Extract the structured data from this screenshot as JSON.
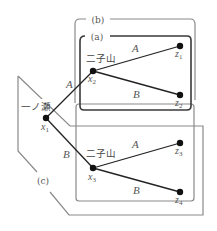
{
  "diagram": {
    "title": "",
    "colors": {
      "background": "#ffffff",
      "frame_b": "#8a8a8a",
      "frame_a": "#3a3a3a",
      "frame_c": "#8a8a8a",
      "edge": "#222222",
      "node": "#111111",
      "label": "#555555"
    },
    "regions": [
      {
        "id": "b",
        "label": "(b)"
      },
      {
        "id": "a",
        "label": "(a)"
      },
      {
        "id": "c",
        "label": "(c)"
      }
    ],
    "places": {
      "ichinose": "一ノ瀬",
      "futagoyama_upper": "二子山",
      "futagoyama_lower": "二子山"
    },
    "nodes": [
      {
        "id": "x1",
        "label": "x",
        "sub": "1"
      },
      {
        "id": "x2",
        "label": "x",
        "sub": "2"
      },
      {
        "id": "x3",
        "label": "x",
        "sub": "3"
      },
      {
        "id": "z1",
        "label": "z",
        "sub": "1"
      },
      {
        "id": "z2",
        "label": "z",
        "sub": "2"
      },
      {
        "id": "z3",
        "label": "z",
        "sub": "3"
      },
      {
        "id": "z4",
        "label": "z",
        "sub": "4"
      }
    ],
    "edges": [
      {
        "from": "x1",
        "to": "x2",
        "label": "A"
      },
      {
        "from": "x1",
        "to": "x3",
        "label": "B"
      },
      {
        "from": "x2",
        "to": "z1",
        "label": "A"
      },
      {
        "from": "x2",
        "to": "z2",
        "label": "B"
      },
      {
        "from": "x3",
        "to": "z3",
        "label": "A"
      },
      {
        "from": "x3",
        "to": "z4",
        "label": "B"
      }
    ]
  }
}
